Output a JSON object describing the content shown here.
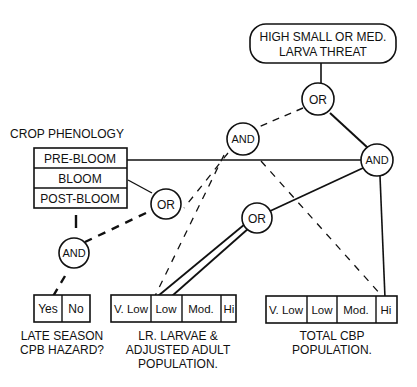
{
  "diagram": {
    "goal": {
      "line1": "HIGH SMALL OR MED.",
      "line2": "LARVA THREAT"
    },
    "gates": {
      "or_top": "OR",
      "and_center": "AND",
      "and_right": "AND",
      "or_left": "OR",
      "or_mid": "OR",
      "and_left": "AND"
    },
    "crop_phenology": {
      "title": "CROP PHENOLOGY",
      "rows": [
        "PRE-BLOOM",
        "BLOOM",
        "POST-BLOOM"
      ]
    },
    "late_season": {
      "cells": [
        "Yes",
        "No"
      ],
      "caption1": "LATE SEASON",
      "caption2": "CPB HAZARD?"
    },
    "larvae_pop": {
      "cells": [
        "V. Low",
        "Low",
        "Mod.",
        "Hi"
      ],
      "caption1": "LR. LARVAE &",
      "caption2": "ADJUSTED ADULT",
      "caption3": "POPULATION."
    },
    "total_pop": {
      "cells": [
        "V. Low",
        "Low",
        "Mod.",
        "Hi"
      ],
      "caption1": "TOTAL CBP",
      "caption2": "POPULATION."
    }
  }
}
